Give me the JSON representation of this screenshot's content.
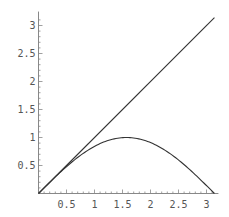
{
  "chart_data": {
    "type": "line",
    "title": "",
    "xlabel": "",
    "ylabel": "",
    "xlim": [
      0,
      3.14159
    ],
    "ylim": [
      0,
      3.14159
    ],
    "grid": false,
    "legend": null,
    "x_ticks": [
      0.5,
      1,
      1.5,
      2,
      2.5,
      3
    ],
    "x_tick_labels": [
      "0.5",
      "1",
      "1.5",
      "2",
      "2.5",
      "3"
    ],
    "y_ticks": [
      0.5,
      1,
      1.5,
      2,
      2.5,
      3
    ],
    "y_tick_labels": [
      "0.5",
      "1",
      "1.5",
      "2",
      "2.5",
      "3"
    ],
    "series": [
      {
        "name": "x",
        "x": [
          0,
          3.14159
        ],
        "y": [
          0,
          3.14159
        ]
      },
      {
        "name": "sin(x)",
        "x": [
          0,
          0.25,
          0.5,
          0.75,
          1.0,
          1.25,
          1.5,
          1.5708,
          1.75,
          2.0,
          2.25,
          2.5,
          2.75,
          3.0,
          3.14159
        ],
        "y": [
          0,
          0.247,
          0.479,
          0.682,
          0.841,
          0.949,
          0.997,
          1.0,
          0.984,
          0.909,
          0.778,
          0.598,
          0.382,
          0.141,
          0
        ]
      }
    ],
    "colors": {
      "axis": "#888888",
      "line": "#333333",
      "text": "#555555"
    }
  }
}
